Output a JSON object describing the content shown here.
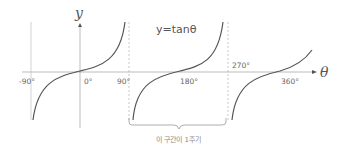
{
  "diagram": {
    "title": "y=tanθ",
    "y_axis_label": "y",
    "x_axis_label": "θ",
    "x_ticks": [
      {
        "label": "-90°",
        "x": 22,
        "y": 84
      },
      {
        "label": "0°",
        "x": 84,
        "y": 84
      },
      {
        "label": "90°",
        "x": 118,
        "y": 84
      },
      {
        "label": "180°",
        "x": 180,
        "y": 84
      },
      {
        "label": "270°",
        "x": 232,
        "y": 68
      },
      {
        "label": "360°",
        "x": 280,
        "y": 84
      }
    ],
    "asymptotes": [
      "-90°",
      "90°",
      "270°"
    ],
    "period_note": "이 구간이 1주기",
    "colors": {
      "curve": "#555555",
      "axis": "#999999",
      "asymptote": "#bbbbbb"
    }
  }
}
